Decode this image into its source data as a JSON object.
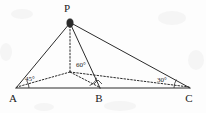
{
  "figure": {
    "background_color": "#fdfdfd",
    "ink_color": "#2b2b2b",
    "width": 206,
    "height": 113
  },
  "vertices": {
    "p": {
      "label": "P",
      "x": 70,
      "y": 21,
      "label_x": 67,
      "label_y": 12
    },
    "a": {
      "label": "A",
      "x": 16,
      "y": 88,
      "label_x": 12,
      "label_y": 101
    },
    "b": {
      "label": "B",
      "x": 100,
      "y": 88,
      "label_x": 96,
      "label_y": 101
    },
    "c": {
      "label": "C",
      "x": 190,
      "y": 88,
      "label_x": 187,
      "label_y": 101
    },
    "q": {
      "label": "",
      "x": 70,
      "y": 72,
      "label_x": 70,
      "label_y": 72
    }
  },
  "angles": [
    {
      "name": "angle-at-a",
      "label": "45°",
      "label_x": 24,
      "label_y": 80,
      "vertex_x": 16,
      "vertex_y": 88,
      "arc_radius": 13
    },
    {
      "name": "angle-at-q",
      "label": "60°",
      "label_x": 74,
      "label_y": 67,
      "vertex_x": 100,
      "vertex_y": 88,
      "arc_radius": 11
    },
    {
      "name": "angle-at-c",
      "label": "30°",
      "label_x": 156,
      "label_y": 82,
      "vertex_x": 190,
      "vertex_y": 88,
      "arc_radius": 16
    }
  ],
  "solid_edges": [
    {
      "name": "edge-pa",
      "x1": 70,
      "y1": 23,
      "x2": 16,
      "y2": 88
    },
    {
      "name": "edge-pb",
      "x1": 70,
      "y1": 23,
      "x2": 100,
      "y2": 88
    },
    {
      "name": "edge-pc",
      "x1": 71,
      "y1": 23,
      "x2": 190,
      "y2": 88
    },
    {
      "name": "edge-ab",
      "x1": 16,
      "y1": 88,
      "x2": 100,
      "y2": 88
    },
    {
      "name": "edge-bc",
      "x1": 100,
      "y1": 88,
      "x2": 190,
      "y2": 88
    }
  ],
  "dotted_edges": [
    {
      "name": "edge-pq-altitude",
      "x1": 70,
      "y1": 26,
      "x2": 70,
      "y2": 72
    },
    {
      "name": "edge-qa",
      "x1": 70,
      "y1": 72,
      "x2": 17,
      "y2": 87
    },
    {
      "name": "edge-qb",
      "x1": 70,
      "y1": 72,
      "x2": 99,
      "y2": 87
    },
    {
      "name": "edge-qc",
      "x1": 70,
      "y1": 72,
      "x2": 189,
      "y2": 87
    }
  ],
  "markers": {
    "apex_marker": {
      "name": "point-p-marker",
      "cx": 70,
      "cy": 23,
      "rx": 3.2,
      "ry": 4.2
    }
  },
  "right_angle_mark": {
    "name": "right-angle-mark-at-b",
    "points": "94,84 98,80 102,84"
  }
}
